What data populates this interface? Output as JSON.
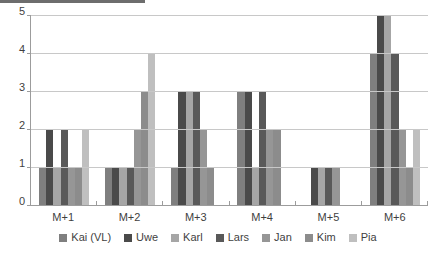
{
  "chart_data": {
    "type": "bar",
    "title": "",
    "xlabel": "",
    "ylabel": "",
    "categories": [
      "M+1",
      "M+2",
      "M+3",
      "M+4",
      "M+5",
      "M+6"
    ],
    "ylim": [
      0,
      5
    ],
    "yticks": [
      0,
      1,
      2,
      3,
      4,
      5
    ],
    "grid": true,
    "legend_position": "bottom",
    "series": [
      {
        "name": "Kai (VL)",
        "color": "#7f7f7f",
        "values": [
          1,
          1,
          1,
          3,
          0,
          4
        ]
      },
      {
        "name": "Uwe",
        "color": "#4a4a4a",
        "values": [
          2,
          1,
          3,
          3,
          1,
          5
        ]
      },
      {
        "name": "Karl",
        "color": "#a6a6a6",
        "values": [
          1,
          1,
          3,
          1,
          1,
          5
        ]
      },
      {
        "name": "Lars",
        "color": "#595959",
        "values": [
          2,
          1,
          3,
          3,
          1,
          4
        ]
      },
      {
        "name": "Jan",
        "color": "#969696",
        "values": [
          1,
          2,
          2,
          2,
          1,
          2
        ]
      },
      {
        "name": "Kim",
        "color": "#8c8c8c",
        "values": [
          1,
          3,
          1,
          2,
          0,
          1
        ]
      },
      {
        "name": "Pia",
        "color": "#bfbfbf",
        "values": [
          2,
          4,
          0,
          0,
          0,
          2
        ]
      }
    ]
  },
  "axis": {
    "y_tick_labels": [
      "0",
      "1",
      "2",
      "3",
      "4",
      "5"
    ]
  },
  "colors": {
    "gridline": "#c8c8c8",
    "axis": "#9c9c9c",
    "text": "#3f3f3f",
    "background": "#ffffff"
  }
}
